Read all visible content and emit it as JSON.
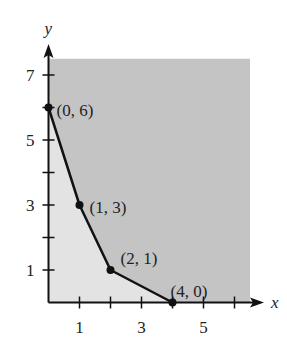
{
  "chart_data": {
    "type": "line",
    "title": "",
    "xlabel": "x",
    "ylabel": "y",
    "xlim": [
      0,
      6.5
    ],
    "ylim": [
      0,
      7.5
    ],
    "grid": false,
    "x_ticks": [
      1,
      2,
      3,
      4,
      5,
      6
    ],
    "x_tick_labels": [
      "1",
      "",
      "3",
      "",
      "5",
      ""
    ],
    "y_ticks": [
      1,
      2,
      3,
      4,
      5,
      6,
      7
    ],
    "y_tick_labels": [
      "1",
      "",
      "3",
      "",
      "5",
      "",
      "7"
    ],
    "series": [
      {
        "name": "boundary",
        "points": [
          [
            0,
            6
          ],
          [
            1,
            3
          ],
          [
            2,
            1
          ],
          [
            4,
            0
          ]
        ]
      }
    ],
    "annotations": [
      {
        "text": "(0, 6)",
        "x": 0,
        "y": 6
      },
      {
        "text": "(1, 3)",
        "x": 1,
        "y": 3
      },
      {
        "text": "(2, 1)",
        "x": 2,
        "y": 1
      },
      {
        "text": "(4, 0)",
        "x": 4,
        "y": 0
      }
    ],
    "regions": [
      {
        "name": "below-boundary",
        "color": "#e3e3e3"
      },
      {
        "name": "above-boundary (shaded feasible region)",
        "color": "#c4c4c4"
      }
    ]
  },
  "colors": {
    "axis": "#111111",
    "curve": "#111111",
    "region_light": "#e3e3e3",
    "region_dark": "#c4c4c4"
  }
}
